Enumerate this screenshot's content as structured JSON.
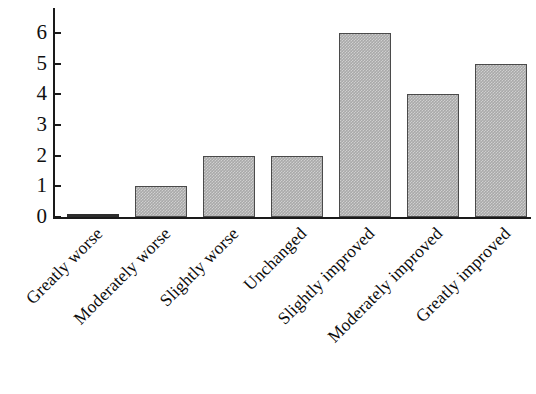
{
  "chart_data": {
    "type": "bar",
    "title": "",
    "subtitle": "",
    "xlabel": "",
    "ylabel": "",
    "categories": [
      "Greatly worse",
      "Moderately worse",
      "Slightly worse",
      "Unchanged",
      "Slightly improved",
      "Moderately improved",
      "Greatly improved"
    ],
    "values": [
      0,
      1,
      2,
      2,
      6,
      4,
      5
    ],
    "ylim": [
      0,
      6.8
    ],
    "y_ticks": [
      0,
      1,
      2,
      3,
      4,
      5,
      6
    ],
    "y_tick_labels": [
      "0",
      "1",
      "2",
      "3",
      "4",
      "5",
      "6"
    ],
    "grid": false,
    "legend": false,
    "legend_position": "none",
    "bar_fill_color": "#a9a9a9",
    "bar_edge_color": "#4a4a4a",
    "axis_color": "#1a1a1a",
    "background_color": "#ffffff",
    "x_label_rotation_deg": 45
  }
}
